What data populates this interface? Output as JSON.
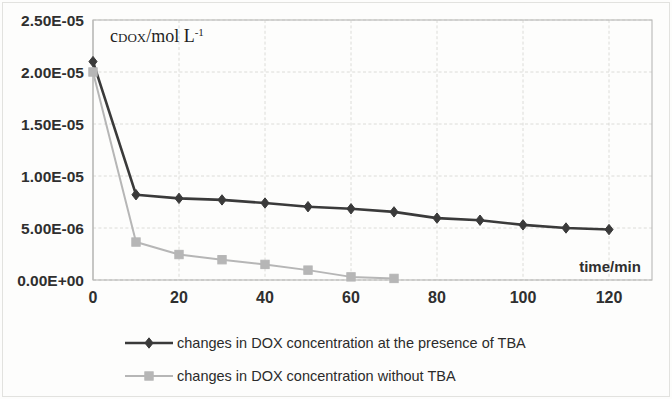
{
  "chart_data": {
    "type": "line",
    "title": "",
    "xlabel": "time/min",
    "ylabel": "c_DOX/mol L^-1",
    "ylabel_parts": {
      "c": "c",
      "sub": "DOX",
      "rest": "/mol L",
      "sup": "-1"
    },
    "xlim": [
      0,
      130
    ],
    "ylim": [
      0,
      2.5e-05
    ],
    "grid": true,
    "legend_position": "bottom-left",
    "x_ticks": [
      0,
      20,
      40,
      60,
      80,
      100,
      120
    ],
    "x_tick_labels": [
      "0",
      "20",
      "40",
      "60",
      "80",
      "100",
      "120"
    ],
    "y_ticks": [
      0,
      5e-06,
      1e-05,
      1.5e-05,
      2e-05,
      2.5e-05
    ],
    "y_tick_labels": [
      "0.00E+00",
      "5.00E-06",
      "1.00E-05",
      "1.50E-05",
      "2.00E-05",
      "2.50E-05"
    ],
    "series": [
      {
        "name": "changes in DOX concentration at the presence of TBA",
        "color": "#3a3a3a",
        "marker": "diamond",
        "x": [
          0,
          10,
          20,
          30,
          40,
          50,
          60,
          70,
          80,
          90,
          100,
          110,
          120
        ],
        "values": [
          2.1e-05,
          8.2e-06,
          7.85e-06,
          7.7e-06,
          7.4e-06,
          7.05e-06,
          6.85e-06,
          6.55e-06,
          5.95e-06,
          5.75e-06,
          5.3e-06,
          5e-06,
          4.85e-06
        ]
      },
      {
        "name": "changes in DOX concentration without TBA",
        "color": "#b6b6b6",
        "marker": "square",
        "x": [
          0,
          10,
          20,
          30,
          40,
          50,
          60,
          70
        ],
        "values": [
          2e-05,
          3.65e-06,
          2.45e-06,
          1.95e-06,
          1.5e-06,
          9.5e-07,
          3e-07,
          1.5e-07
        ]
      }
    ]
  },
  "legend": {
    "items": [
      {
        "label": "changes in DOX concentration at the presence of TBA",
        "color": "#3a3a3a",
        "marker": "diamond"
      },
      {
        "label": "changes in DOX concentration without TBA",
        "color": "#b6b6b6",
        "marker": "square"
      }
    ]
  }
}
